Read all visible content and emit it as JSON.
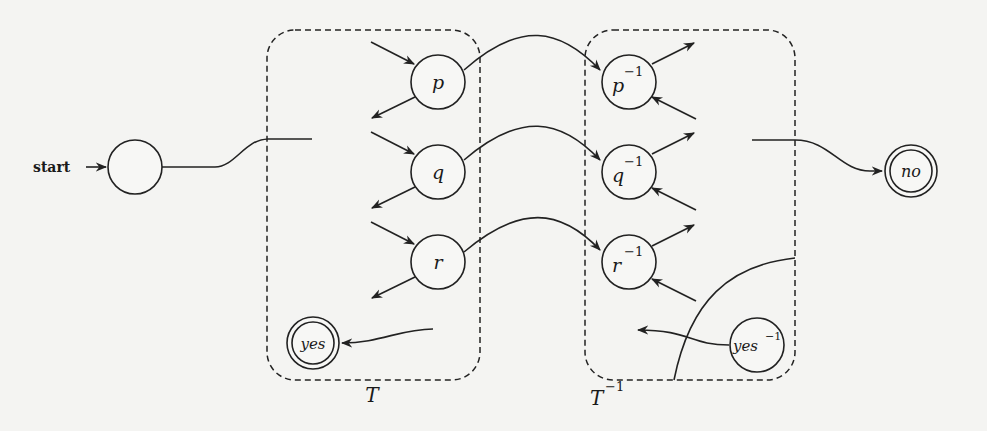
{
  "diagram": {
    "start_label": "start",
    "boxes": {
      "T": {
        "label": "T",
        "label_sup": ""
      },
      "T_inv": {
        "label": "T",
        "label_sup": "−1"
      }
    },
    "nodes": {
      "start": {
        "label": ""
      },
      "p": {
        "label": "p",
        "sup": ""
      },
      "q": {
        "label": "q",
        "sup": ""
      },
      "r": {
        "label": "r",
        "sup": ""
      },
      "yes": {
        "label": "yes",
        "sup": "",
        "accepting": true
      },
      "p_inv": {
        "label": "p",
        "sup": "−1"
      },
      "q_inv": {
        "label": "q",
        "sup": "−1"
      },
      "r_inv": {
        "label": "r",
        "sup": "−1"
      },
      "yes_inv": {
        "label": "yes",
        "sup": "−1"
      },
      "no": {
        "label": "no",
        "sup": "",
        "accepting": true
      }
    },
    "edges": [
      {
        "from": "start",
        "to": "T"
      },
      {
        "from": "p",
        "to": "p_inv"
      },
      {
        "from": "q",
        "to": "q_inv"
      },
      {
        "from": "r",
        "to": "r_inv"
      },
      {
        "from": "T",
        "to": "yes"
      },
      {
        "from": "T_inv",
        "to": "no"
      },
      {
        "from": "yes_inv",
        "to": "T_inv"
      }
    ]
  }
}
